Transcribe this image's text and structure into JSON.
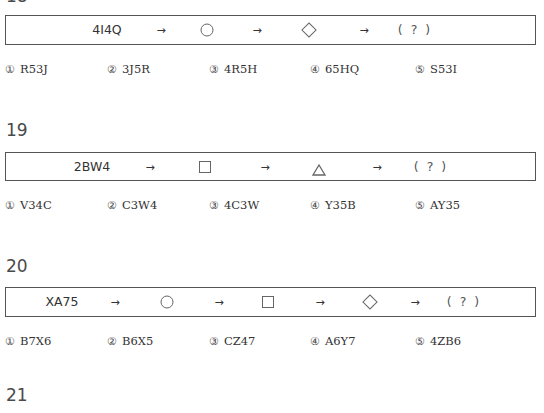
{
  "questions": [
    {
      "number": "18",
      "sequence": {
        "start": "4I4Q",
        "arrow": "→",
        "shapes": [
          "circle",
          "diamond"
        ],
        "answer_placeholder": "( ? )"
      },
      "options": [
        {
          "marker": "①",
          "text": "R53J"
        },
        {
          "marker": "②",
          "text": "3J5R"
        },
        {
          "marker": "③",
          "text": "4R5H"
        },
        {
          "marker": "④",
          "text": "65HQ"
        },
        {
          "marker": "⑤",
          "text": "S53I"
        }
      ]
    },
    {
      "number": "19",
      "sequence": {
        "start": "2BW4",
        "arrow": "→",
        "shapes": [
          "square",
          "triangle"
        ],
        "answer_placeholder": "( ? )"
      },
      "options": [
        {
          "marker": "①",
          "text": "V34C"
        },
        {
          "marker": "②",
          "text": "C3W4"
        },
        {
          "marker": "③",
          "text": "4C3W"
        },
        {
          "marker": "④",
          "text": "Y35B"
        },
        {
          "marker": "⑤",
          "text": "AY35"
        }
      ]
    },
    {
      "number": "20",
      "sequence": {
        "start": "XA75",
        "arrow": "→",
        "shapes": [
          "circle",
          "square",
          "diamond"
        ],
        "answer_placeholder": "( ? )"
      },
      "options": [
        {
          "marker": "①",
          "text": "B7X6"
        },
        {
          "marker": "②",
          "text": "B6X5"
        },
        {
          "marker": "③",
          "text": "CZ47"
        },
        {
          "marker": "④",
          "text": "A6Y7"
        },
        {
          "marker": "⑤",
          "text": "4ZB6"
        }
      ]
    },
    {
      "number": "21"
    }
  ]
}
